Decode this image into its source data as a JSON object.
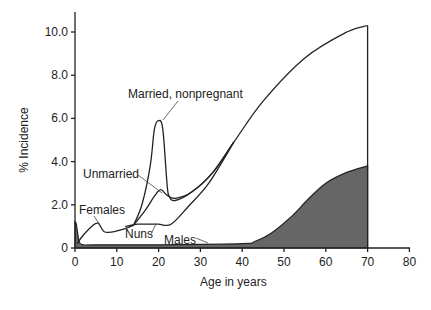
{
  "chart_data": {
    "type": "line",
    "title": "",
    "xlabel": "Age in years",
    "ylabel": "% Incidence",
    "xlim": [
      0,
      80
    ],
    "ylim": [
      0,
      10.8
    ],
    "x_ticks": [
      0,
      10,
      20,
      30,
      40,
      50,
      60,
      70,
      80
    ],
    "x_tick_labels": [
      "0",
      "10",
      "20",
      "30",
      "40",
      "50",
      "60",
      "70",
      "80"
    ],
    "y_ticks": [
      0,
      2,
      4,
      6,
      8,
      10
    ],
    "y_tick_labels": [
      "0",
      "2.0",
      "4.0",
      "6.0",
      "8.0",
      "10.0"
    ],
    "grid": false,
    "legend": "none (inline annotations)",
    "series": [
      {
        "name": "Females",
        "x": [
          0.5,
          2,
          4,
          5.5,
          7,
          9,
          12,
          14
        ],
        "values": [
          0.2,
          0.6,
          1.0,
          1.15,
          0.75,
          0.75,
          0.9,
          1.05
        ]
      },
      {
        "name": "Married, nonpregnant",
        "x": [
          14,
          16,
          18,
          19,
          20,
          21,
          22,
          22.5,
          24,
          28,
          33,
          38,
          45,
          55,
          65,
          70
        ],
        "values": [
          1.05,
          2.0,
          3.8,
          5.5,
          5.9,
          5.5,
          3.0,
          2.4,
          2.2,
          2.6,
          3.5,
          4.9,
          6.8,
          8.8,
          10.0,
          10.3
        ]
      },
      {
        "name": "Unmarried",
        "x": [
          14,
          17,
          19,
          20.5,
          22,
          24,
          28,
          33,
          38
        ],
        "values": [
          1.05,
          1.8,
          2.4,
          2.7,
          2.45,
          2.3,
          2.6,
          3.5,
          4.9
        ]
      },
      {
        "name": "Nuns",
        "x": [
          12,
          15,
          18,
          20,
          23,
          27,
          32,
          38
        ],
        "values": [
          1.0,
          1.1,
          1.1,
          1.1,
          1.1,
          1.9,
          3.0,
          4.9
        ]
      },
      {
        "name": "Males",
        "type": "area",
        "x": [
          0,
          0.3,
          1,
          2,
          5,
          20,
          40,
          43,
          47,
          52,
          56,
          60,
          65,
          70
        ],
        "values": [
          1.2,
          1.1,
          0.3,
          0.15,
          0.15,
          0.15,
          0.2,
          0.3,
          0.7,
          1.5,
          2.3,
          3.0,
          3.5,
          3.8
        ]
      }
    ],
    "annotations": [
      {
        "text": "Married, nonpregnant",
        "points_to": {
          "x": 20.5,
          "y": 5.9
        }
      },
      {
        "text": "Unmarried",
        "points_to": {
          "x": 20,
          "y": 2.5
        }
      },
      {
        "text": "Females",
        "points_to": {
          "x": 5.5,
          "y": 1.15
        }
      },
      {
        "text": "Nuns",
        "points_to": {
          "x": 18,
          "y": 1.1
        }
      },
      {
        "text": "Males",
        "points_to": {
          "x": 32,
          "y": 0.18
        }
      }
    ],
    "colors": {
      "line": "#222222",
      "male_fill": "#666666"
    }
  }
}
